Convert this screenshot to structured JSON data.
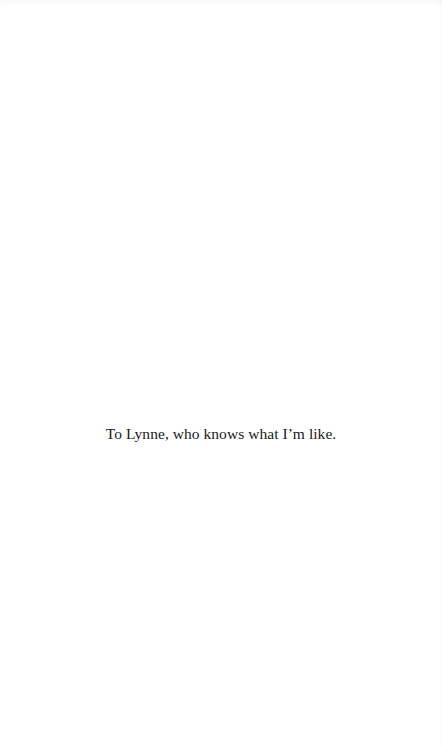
{
  "page": {
    "dedication": "To Lynne, who knows what I’m like."
  }
}
